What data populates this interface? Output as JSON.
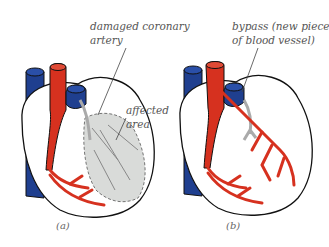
{
  "diagram": {
    "panels": [
      {
        "id": "a",
        "caption": "(a)",
        "labels": {
          "damaged_line1": "damaged coronary",
          "damaged_line2": "artery",
          "affected_line1": "affected",
          "affected_line2": "area"
        }
      },
      {
        "id": "b",
        "caption": "(b)",
        "labels": {
          "bypass_line1": "bypass (new piece",
          "bypass_line2": "of blood vessel)"
        }
      }
    ],
    "colors": {
      "artery_red": "#d6311f",
      "vein_blue": "#1f3f8f",
      "affected_grey": "#d9dbd9",
      "outline": "#222222",
      "label_text": "#555555"
    }
  }
}
